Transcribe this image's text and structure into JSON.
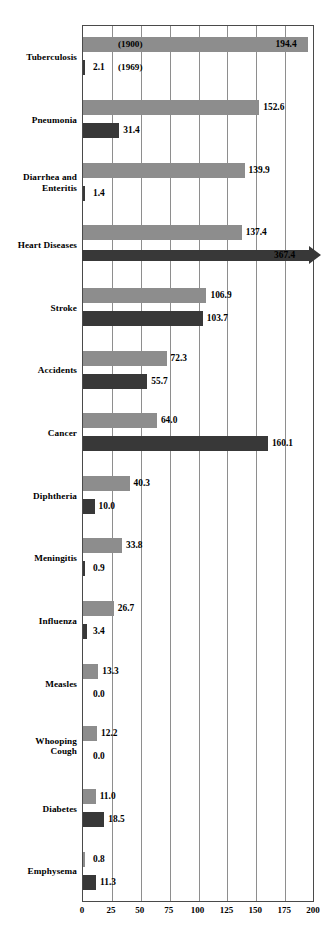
{
  "chart_data": {
    "type": "bar",
    "orientation": "horizontal",
    "title": "",
    "subtitle": "",
    "xlabel": "",
    "ylabel": "",
    "xlim": [
      0,
      200
    ],
    "xticks": [
      0,
      25,
      50,
      75,
      100,
      125,
      150,
      175,
      200
    ],
    "xtick_labels": [
      "0",
      "25",
      "50",
      "75",
      "100",
      "125",
      "150",
      "175",
      "200"
    ],
    "grid": true,
    "grid_axis": "x",
    "legend": "none",
    "categories": [
      "Tuberculosis",
      "Pneumonia",
      "Diarrhea and Enteritis",
      "Heart Diseases",
      "Stroke",
      "Accidents",
      "Cancer",
      "Diphtheria",
      "Meningitis",
      "Influenza",
      "Measles",
      "Whooping Cough",
      "Diabetes",
      "Emphysema"
    ],
    "series": [
      {
        "name": "1900",
        "color": "#8d8d8d",
        "values": [
          194.4,
          152.6,
          139.9,
          137.4,
          106.9,
          72.3,
          64.0,
          40.3,
          33.8,
          26.7,
          13.3,
          12.2,
          11.0,
          0.8
        ]
      },
      {
        "name": "1969",
        "color": "#383838",
        "values": [
          2.1,
          31.4,
          1.4,
          367.4,
          103.7,
          55.7,
          160.1,
          10.0,
          0.9,
          3.4,
          0.0,
          0.0,
          18.5,
          11.3
        ]
      }
    ],
    "annotations": [
      {
        "text": "(1900)",
        "series": "1900",
        "category": "Tuberculosis"
      },
      {
        "text": "(1969)",
        "series": "1969",
        "category": "Tuberculosis"
      }
    ],
    "overflow_bars": [
      {
        "category": "Heart Diseases",
        "series": "1969",
        "value": 367.4,
        "note": "bar exceeds axis maximum and is drawn with an arrowhead"
      }
    ]
  },
  "rows": [
    {
      "label": "Tuberculosis",
      "top": [
        {
          "value": 194.4,
          "text": "194.4",
          "series": "1900",
          "label_inside": true,
          "annotation": "(1900)"
        }
      ],
      "bottom": [
        {
          "value": 2.1,
          "text": "2.1",
          "series": "1969",
          "label_inside": false,
          "annotation": "(1969)"
        }
      ]
    },
    {
      "label": "Pneumonia",
      "top": [
        {
          "value": 152.6,
          "text": "152.6",
          "series": "1900",
          "label_inside": false
        }
      ],
      "bottom": [
        {
          "value": 31.4,
          "text": "31.4",
          "series": "1969",
          "label_inside": false
        }
      ]
    },
    {
      "label": "Diarrhea and Enteritis",
      "label_lines": [
        "Diarrhea and",
        "Enteritis"
      ],
      "top": [
        {
          "value": 139.9,
          "text": "139.9",
          "series": "1900",
          "label_inside": false
        }
      ],
      "bottom": [
        {
          "value": 1.4,
          "text": "1.4",
          "series": "1969",
          "label_inside": false
        }
      ]
    },
    {
      "label": "Heart Diseases",
      "top": [
        {
          "value": 137.4,
          "text": "137.4",
          "series": "1900",
          "label_inside": false
        }
      ],
      "bottom": [
        {
          "value": 367.4,
          "text": "367.4",
          "series": "1969",
          "label_inside": true,
          "arrow": true
        }
      ]
    },
    {
      "label": "Stroke",
      "top": [
        {
          "value": 106.9,
          "text": "106.9",
          "series": "1900",
          "label_inside": false
        }
      ],
      "bottom": [
        {
          "value": 103.7,
          "text": "103.7",
          "series": "1969",
          "label_inside": false
        }
      ]
    },
    {
      "label": "Accidents",
      "top": [
        {
          "value": 72.3,
          "text": "72.3",
          "series": "1900",
          "label_inside": false
        }
      ],
      "bottom": [
        {
          "value": 55.7,
          "text": "55.7",
          "series": "1969",
          "label_inside": false
        }
      ]
    },
    {
      "label": "Cancer",
      "top": [
        {
          "value": 64.0,
          "text": "64.0",
          "series": "1900",
          "label_inside": false
        }
      ],
      "bottom": [
        {
          "value": 160.1,
          "text": "160.1",
          "series": "1969",
          "label_inside": false
        }
      ]
    },
    {
      "label": "Diphtheria",
      "top": [
        {
          "value": 40.3,
          "text": "40.3",
          "series": "1900",
          "label_inside": false
        }
      ],
      "bottom": [
        {
          "value": 10.0,
          "text": "10.0",
          "series": "1969",
          "label_inside": false
        }
      ]
    },
    {
      "label": "Meningitis",
      "top": [
        {
          "value": 33.8,
          "text": "33.8",
          "series": "1900",
          "label_inside": false
        }
      ],
      "bottom": [
        {
          "value": 0.9,
          "text": "0.9",
          "series": "1969",
          "label_inside": false
        }
      ]
    },
    {
      "label": "Influenza",
      "top": [
        {
          "value": 26.7,
          "text": "26.7",
          "series": "1900",
          "label_inside": false
        }
      ],
      "bottom": [
        {
          "value": 3.4,
          "text": "3.4",
          "series": "1969",
          "label_inside": false
        }
      ]
    },
    {
      "label": "Measles",
      "top": [
        {
          "value": 13.3,
          "text": "13.3",
          "series": "1900",
          "label_inside": false
        }
      ],
      "bottom": [
        {
          "value": 0.0,
          "text": "0.0",
          "series": "1969",
          "label_inside": false
        }
      ]
    },
    {
      "label": "Whooping Cough",
      "label_lines": [
        "Whooping",
        "Cough"
      ],
      "top": [
        {
          "value": 12.2,
          "text": "12.2",
          "series": "1900",
          "label_inside": false
        }
      ],
      "bottom": [
        {
          "value": 0.0,
          "text": "0.0",
          "series": "1969",
          "label_inside": false
        }
      ]
    },
    {
      "label": "Diabetes",
      "top": [
        {
          "value": 11.0,
          "text": "11.0",
          "series": "1900",
          "label_inside": false
        }
      ],
      "bottom": [
        {
          "value": 18.5,
          "text": "18.5",
          "series": "1969",
          "label_inside": false
        }
      ]
    },
    {
      "label": "Emphysema",
      "top": [
        {
          "value": 0.8,
          "text": "0.8",
          "series": "1900",
          "label_inside": false
        }
      ],
      "bottom": [
        {
          "value": 11.3,
          "text": "11.3",
          "series": "1969",
          "label_inside": false
        }
      ]
    }
  ],
  "colors": {
    "series_1900": "#8d8d8d",
    "series_1969": "#383838",
    "axis": "#4a4a4a",
    "grid": "#8e8e8e",
    "text": "#000000",
    "background": "#ffffff"
  }
}
